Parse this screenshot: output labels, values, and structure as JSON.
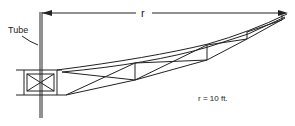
{
  "diagram": {
    "labels": {
      "tube": "Tube",
      "radius_symbol": "r",
      "radius_value": "r = 10 ft."
    },
    "colors": {
      "line": "#222222",
      "background": "#ffffff"
    },
    "elements": {
      "tube": "vertical tube (mast)",
      "hub": "central box with X bracing",
      "truss_arm": "tapered truss arm extending right",
      "dimension_arrow": "horizontal arrow indicating radius r"
    }
  }
}
